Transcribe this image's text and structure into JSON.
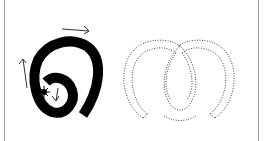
{
  "figure": {
    "left_panel": {
      "description": "solid black spiral stroke with direction arrows and start marker",
      "stroke_color": "#000000",
      "arrows": [
        "right",
        "up",
        "down"
      ],
      "start_marker": "star-icon"
    },
    "right_panel": {
      "description": "dotted outline of looping stroke",
      "stroke_color": "#555555",
      "style": "dotted"
    },
    "border_color": "#9a9a9a"
  }
}
